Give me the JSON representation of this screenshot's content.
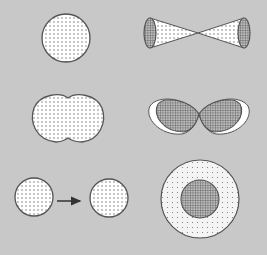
{
  "diagram": {
    "background": "#c8c8c8",
    "outline_color": "#555555",
    "dot_fill_bg": "#ffffff",
    "grid_fill_bg": "#9a9a9a",
    "shapes": [
      {
        "id": "sphere",
        "type": "dotted-circle",
        "cx": 66,
        "cy": 38,
        "r": 24
      },
      {
        "id": "bowtie",
        "type": "double-cone",
        "cx": 198,
        "cy": 33,
        "half_width": 49,
        "end_ry": 15,
        "end_rx": 6
      },
      {
        "id": "peanut",
        "type": "dotted-peanut",
        "cx": 68,
        "cy": 118
      },
      {
        "id": "figure-eight",
        "type": "hatched-lobes",
        "cx": 199,
        "cy": 114
      },
      {
        "id": "circle-left",
        "type": "dotted-circle",
        "cx": 34,
        "cy": 197,
        "r": 19
      },
      {
        "id": "arrow",
        "type": "arrow",
        "x1": 57,
        "x2": 82,
        "y": 201
      },
      {
        "id": "circle-right",
        "type": "dotted-circle",
        "cx": 109,
        "cy": 198,
        "r": 19
      },
      {
        "id": "ring",
        "type": "ring",
        "cx": 200,
        "cy": 199,
        "r_outer": 39,
        "r_inner": 19
      }
    ]
  }
}
